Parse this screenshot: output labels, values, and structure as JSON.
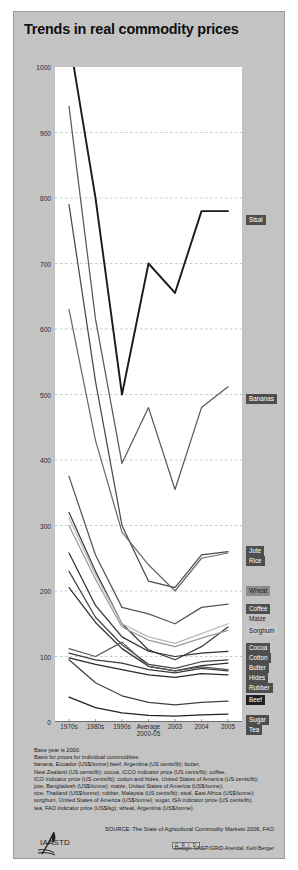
{
  "title": "Trends in real commodity prices",
  "chart_data": {
    "type": "line",
    "title": "Trends in real commodity prices",
    "xlabel": "",
    "ylabel": "",
    "ylim": [
      0,
      1000
    ],
    "yticks": [
      0,
      100,
      200,
      300,
      400,
      500,
      600,
      700,
      800,
      900,
      1000
    ],
    "grid": true,
    "legend_position": "right",
    "categories": [
      "1970s",
      "1980s",
      "1990s",
      "Average 2000-05",
      "2003",
      "2004",
      "2005"
    ],
    "x_tick_labels": [
      {
        "label": "1970s",
        "sub": ""
      },
      {
        "label": "1980s",
        "sub": ""
      },
      {
        "label": "1990s",
        "sub": ""
      },
      {
        "label": "Average",
        "sub": "2000-05"
      },
      {
        "label": "2003",
        "sub": ""
      },
      {
        "label": "2004",
        "sub": ""
      },
      {
        "label": "2005",
        "sub": ""
      }
    ],
    "series": [
      {
        "name": "Sisal",
        "color": "#1a1a1a",
        "values": [
          1045,
          800,
          500,
          700,
          655,
          780,
          780
        ]
      },
      {
        "name": "Bananas",
        "color": "#5a5a5a",
        "values": [
          940,
          615,
          395,
          480,
          355,
          480,
          512
        ]
      },
      {
        "name": "Jute",
        "color": "#4a4a4a",
        "values": [
          790,
          520,
          300,
          215,
          205,
          255,
          260
        ]
      },
      {
        "name": "Rice",
        "color": "#6a6a6a",
        "values": [
          630,
          430,
          290,
          240,
          200,
          250,
          258
        ]
      },
      {
        "name": "Wheat",
        "color": "#555555",
        "values": [
          375,
          255,
          175,
          165,
          150,
          175,
          180
        ]
      },
      {
        "name": "Coffee",
        "color": "#3c3c3c",
        "values": [
          320,
          230,
          150,
          110,
          95,
          115,
          145
        ]
      },
      {
        "name": "Maize",
        "color": "#b9b9b9",
        "values": [
          312,
          225,
          150,
          130,
          120,
          135,
          150
        ]
      },
      {
        "name": "Sorghum",
        "color": "#9a9a9a",
        "values": [
          300,
          218,
          145,
          125,
          115,
          128,
          140
        ]
      },
      {
        "name": "Cocoa",
        "color": "#303030",
        "values": [
          258,
          178,
          130,
          108,
          100,
          105,
          108
        ]
      },
      {
        "name": "Cotton",
        "color": "#444444",
        "values": [
          230,
          160,
          118,
          88,
          82,
          92,
          95
        ]
      },
      {
        "name": "Butter",
        "color": "#2e2e2e",
        "values": [
          205,
          152,
          112,
          85,
          78,
          86,
          90
        ]
      },
      {
        "name": "Hides",
        "color": "#5c5c5c",
        "values": [
          112,
          100,
          122,
          85,
          78,
          84,
          80
        ]
      },
      {
        "name": "Rubber",
        "color": "#3a3a3a",
        "values": [
          105,
          95,
          90,
          80,
          75,
          82,
          78
        ]
      },
      {
        "name": "Beef",
        "color": "#2a2a2a",
        "values": [
          98,
          88,
          80,
          72,
          68,
          74,
          72
        ]
      },
      {
        "name": "Sugar",
        "color": "#404040",
        "values": [
          95,
          60,
          40,
          30,
          26,
          30,
          32
        ]
      },
      {
        "name": "Tea",
        "color": "#222222",
        "values": [
          38,
          22,
          14,
          10,
          9,
          11,
          12
        ]
      }
    ],
    "legend_entries": [
      {
        "label": "Sisal",
        "y": 203,
        "style": "dark"
      },
      {
        "label": "Bananas",
        "y": 382,
        "style": "dark"
      },
      {
        "label": "Jute",
        "y": 534,
        "style": "dark"
      },
      {
        "label": "Rice",
        "y": 544,
        "style": "dark"
      },
      {
        "label": "Wheat",
        "y": 574,
        "style": "mid"
      },
      {
        "label": "Coffee",
        "y": 592,
        "style": "dark"
      },
      {
        "label": "Maize",
        "y": 602,
        "style": "plain"
      },
      {
        "label": "Sorghum",
        "y": 614,
        "style": "light"
      },
      {
        "label": "Cocoa",
        "y": 631,
        "style": "dark"
      },
      {
        "label": "Cotton",
        "y": 641,
        "style": "dark"
      },
      {
        "label": "Butter",
        "y": 651,
        "style": "dark"
      },
      {
        "label": "Hides",
        "y": 661,
        "style": "dark"
      },
      {
        "label": "Rubber",
        "y": 671,
        "style": "dark"
      },
      {
        "label": "Beef",
        "y": 683,
        "style": "darker"
      },
      {
        "label": "Sugar",
        "y": 703,
        "style": "dark"
      },
      {
        "label": "Tea",
        "y": 713,
        "style": "dark"
      }
    ]
  },
  "notes": {
    "lines": [
      "Base year is 2000.",
      "Basis for prices for individual commodities:",
      "banana, Ecuador (US$/tonne);beef, Argentina (US cents/lb); butter,",
      "New Zealand (US cents/lb); cocoa, ICCO indicator price (US cents/lb); coffee,",
      "ICO indicator price (US cents/lb); cotton and hides, United States of America (US cents/lb);",
      "jute, Bangladesh (US$/tonne); maize, United States of America (US$/tonne);",
      "rice, Thailand (US$/tonne); rubber, Malaysia (US cents/lb); sisal, East Africa (US$/tonne);",
      "sorghum, United States of America (US$/tonne); sugar, ISA indicator price (US cents/lb);",
      "tea, FAO indicator price (US$/kg); wheat, Argentina (US$/tonne)."
    ]
  },
  "source": "SOURCE: The State of Agricultural Commodity Markets 2006, FAO",
  "design": "Design: UNEP/GRID-Arendal, Ketil Berger",
  "unep_mark": "G R I D",
  "iaastd": "IAASTD"
}
